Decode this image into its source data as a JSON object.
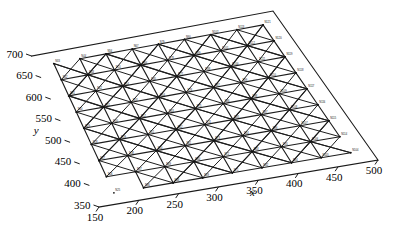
{
  "figure": {
    "kind": "3d-structure-plot",
    "background": "#ffffff",
    "line_color": "#1d1d1d"
  },
  "axes": {
    "x": {
      "label": "x",
      "ticks": [
        "150",
        "200",
        "250",
        "300",
        "350",
        "400",
        "450",
        "500"
      ],
      "min": 150,
      "max": 500,
      "step": 50
    },
    "y": {
      "label": "y",
      "ticks": [
        "350",
        "400",
        "450",
        "500",
        "550",
        "600",
        "650",
        "700"
      ],
      "min": 350,
      "max": 700,
      "step": 50
    }
  },
  "caption": {
    "text": ""
  },
  "chart_data": {
    "type": "scatter",
    "title": "",
    "xlabel": "x",
    "ylabel": "y",
    "xlim": [
      150,
      500
    ],
    "ylim": [
      350,
      700
    ],
    "grid": false,
    "legend": null,
    "xticks": [
      150,
      200,
      250,
      300,
      350,
      400,
      450,
      500
    ],
    "yticks": [
      350,
      400,
      450,
      500,
      550,
      600,
      650,
      700
    ],
    "grid_nx": 9,
    "grid_ny": 9,
    "node_x": [
      175,
      212.5,
      250,
      287.5,
      325,
      362.5,
      400,
      437.5,
      475
    ],
    "node_y": [
      375,
      412.5,
      450,
      487.5,
      525,
      562.5,
      600,
      637.5,
      675
    ],
    "node_labels": [
      "N33",
      "N44",
      "N56",
      "N67",
      "N79",
      "N90",
      "N102",
      "N113",
      "N121",
      "N32",
      "N43",
      "N55",
      "N66",
      "N78",
      "N89",
      "N101",
      "N112",
      "N120",
      "N31",
      "N42",
      "N54",
      "N65",
      "N77",
      "N88",
      "N100",
      "N111",
      "N119",
      "N30",
      "N41",
      "N53",
      "N64",
      "N76",
      "N87",
      "N99",
      "N110",
      "N118",
      "N29",
      "N40",
      "N52",
      "N63",
      "N75",
      "N86",
      "N98",
      "N109",
      "N117",
      "N28",
      "N39",
      "N51",
      "N62",
      "N74",
      "N85",
      "N97",
      "N108",
      "N116",
      "N27",
      "N38",
      "N50",
      "N61",
      "N73",
      "N84",
      "N96",
      "N107",
      "N115",
      "N26",
      "N37",
      "N49",
      "N60",
      "N72",
      "N83",
      "N95",
      "N106",
      "N114",
      "N25",
      "N36",
      "N48",
      "N59",
      "N71",
      "N82",
      "N94",
      "N105",
      "N104"
    ],
    "series": [
      {
        "name": "chord members",
        "style": "solid",
        "width": 1.15,
        "count": 144
      },
      {
        "name": "diagonal bracing",
        "style": "solid",
        "width": 1.0,
        "count": 128
      }
    ]
  }
}
